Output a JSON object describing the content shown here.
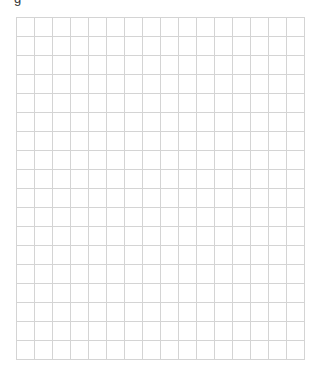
{
  "header": {
    "title_fragment": "g"
  },
  "grid": {
    "columns": 16,
    "rows": 18,
    "line_color": "#d4d4d4",
    "background": "#ffffff"
  }
}
